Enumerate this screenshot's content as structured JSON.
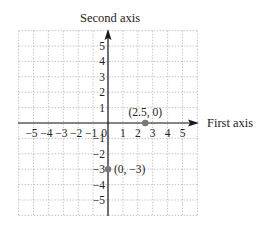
{
  "chart_data": {
    "type": "scatter",
    "title": "",
    "xlabel": "First axis",
    "ylabel": "Second axis",
    "xlim": [
      -6,
      6
    ],
    "ylim": [
      -6,
      6
    ],
    "grid": true,
    "x_ticks": [
      "−5",
      "−4",
      "−3",
      "−2",
      "−1",
      "0",
      "1",
      "2",
      "3",
      "4",
      "5"
    ],
    "y_ticks": [
      "5",
      "4",
      "3",
      "2",
      "1",
      "−1",
      "−2",
      "−3",
      "−4",
      "−5"
    ],
    "points": [
      {
        "x": 2.5,
        "y": 0,
        "label": "(2.5, 0)"
      },
      {
        "x": 0,
        "y": -3,
        "label": "(0, −3)"
      }
    ],
    "colors": {
      "grid": "#b8b8b8",
      "axis": "#1a1a1a",
      "point": "#7a7a7a",
      "text": "#222222"
    }
  }
}
